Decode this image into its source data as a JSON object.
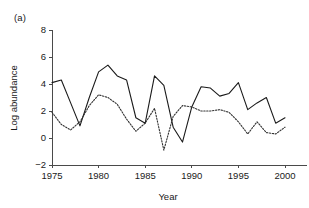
{
  "figure": {
    "panel_label": "(a)",
    "background_color": "#ffffff",
    "width": 309,
    "height": 208
  },
  "chart_data": {
    "type": "line",
    "title": "",
    "subtitle": "",
    "xlabel": "Year",
    "ylabel": "Log abundance",
    "xlim": [
      1975,
      2000
    ],
    "ylim": [
      -2,
      8
    ],
    "xticks": [
      1975,
      1980,
      1985,
      1990,
      1995,
      2000
    ],
    "xtick_labels": [
      "1975",
      "1980",
      "1985",
      "1990",
      "1995",
      "2000"
    ],
    "yticks": [
      -2,
      0,
      2,
      4,
      6,
      8
    ],
    "ytick_labels": [
      "-2",
      "0",
      "2",
      "4",
      "6",
      "8"
    ],
    "grid": false,
    "legend": "none",
    "annotations": [
      "(a)"
    ],
    "x": [
      1975,
      1976,
      1977,
      1978,
      1979,
      1980,
      1981,
      1982,
      1983,
      1984,
      1985,
      1986,
      1987,
      1988,
      1989,
      1990,
      1991,
      1992,
      1993,
      1994,
      1995,
      1996,
      1997,
      1998,
      1999,
      2000
    ],
    "series": [
      {
        "name": "series-solid",
        "style": "solid",
        "color": "#1a1a1a",
        "values": [
          4.1,
          4.3,
          2.6,
          0.9,
          3.0,
          4.9,
          5.4,
          4.6,
          4.3,
          1.5,
          1.1,
          4.6,
          3.9,
          0.8,
          -0.3,
          2.3,
          3.8,
          3.7,
          3.1,
          3.3,
          4.1,
          2.1,
          2.6,
          3.0,
          1.1,
          1.5
        ]
      },
      {
        "name": "series-dotted",
        "style": "dotted",
        "color": "#333333",
        "values": [
          1.9,
          1.0,
          0.6,
          1.2,
          2.4,
          3.2,
          3.0,
          2.5,
          1.4,
          0.5,
          1.1,
          2.2,
          -0.9,
          1.6,
          2.4,
          2.3,
          2.0,
          2.0,
          2.1,
          1.9,
          1.2,
          0.3,
          1.2,
          0.4,
          0.3,
          0.8
        ]
      }
    ]
  },
  "layout": {
    "plot_left": 52,
    "plot_right": 285,
    "plot_top": 30,
    "plot_bottom": 165
  }
}
